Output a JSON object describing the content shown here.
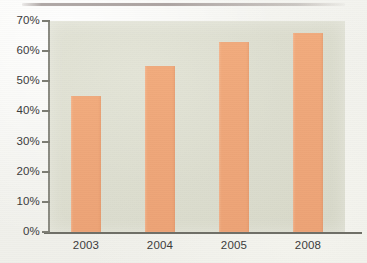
{
  "page": {
    "top_rule": "horizontal-rule"
  },
  "chart_data": {
    "type": "bar",
    "title": "",
    "subtitle": "",
    "xlabel": "",
    "ylabel": "",
    "categories": [
      "2003",
      "2004",
      "2005",
      "2008"
    ],
    "values": [
      45,
      55,
      63,
      66
    ],
    "value_labels": [
      "45%",
      "55%",
      "63%",
      "66%"
    ],
    "ylim": [
      0,
      70
    ],
    "ytick_values": [
      0,
      10,
      20,
      30,
      40,
      50,
      60,
      70
    ],
    "ytick_labels": [
      "0%",
      "10%",
      "20%",
      "30%",
      "40%",
      "50%",
      "60%",
      "70%"
    ],
    "grid": false,
    "legend": null,
    "legend_position": "none",
    "series": [
      {
        "name": "",
        "values": [
          45,
          55,
          63,
          66
        ],
        "color": "#efa77a"
      }
    ],
    "colors": {
      "bar": "#efa77a",
      "plot_background": "#dcddcf",
      "axis": "#7d7d74",
      "text": "#3b3b3b",
      "page_background": "#f1f1ec",
      "rule": "#a09894"
    }
  }
}
